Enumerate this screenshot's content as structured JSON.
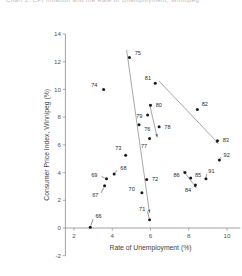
{
  "title_partial": "Chart 1.  CPI Inflation and the Rate of Unemployment, Winnipeg",
  "chart_data": {
    "type": "scatter",
    "title": "",
    "xlabel": "Rate of Unemployment (%)",
    "ylabel": "Consumer Price Index, Winnipeg (%)",
    "xlim": [
      1.2,
      10.8
    ],
    "ylim": [
      -2,
      14
    ],
    "xticks": [
      2,
      4,
      6,
      8,
      10
    ],
    "yticks": [
      -2,
      0,
      2,
      4,
      6,
      8,
      10,
      12,
      14
    ],
    "grid": false,
    "legend": "none",
    "point_label_field": "year",
    "points": [
      {
        "year": "66",
        "x": 2.85,
        "y": 0.05,
        "lx": 3.05,
        "ly": 0.85,
        "leader": true
      },
      {
        "year": "67",
        "x": 3.6,
        "y": 3.05,
        "lx": 3.35,
        "ly": 2.35,
        "leader": true
      },
      {
        "year": "68",
        "x": 4.1,
        "y": 3.9,
        "lx": 4.35,
        "ly": 4.35,
        "leader": true
      },
      {
        "year": "69",
        "x": 3.7,
        "y": 3.55,
        "lx": 3.3,
        "ly": 3.8,
        "leader": true
      },
      {
        "year": "70",
        "x": 5.55,
        "y": 2.55,
        "lx": 5.25,
        "ly": 2.8,
        "leader": false
      },
      {
        "year": "71",
        "x": 5.95,
        "y": 0.6,
        "lx": 5.8,
        "ly": 1.4,
        "leader": true
      },
      {
        "year": "72",
        "x": 5.8,
        "y": 3.5,
        "lx": 6.0,
        "ly": 3.55,
        "leader": false
      },
      {
        "year": "73",
        "x": 4.7,
        "y": 5.25,
        "lx": 4.55,
        "ly": 5.75,
        "leader": false
      },
      {
        "year": "74",
        "x": 3.55,
        "y": 10.0,
        "lx": 3.3,
        "ly": 10.35,
        "leader": false
      },
      {
        "year": "75",
        "x": 4.9,
        "y": 12.3,
        "lx": 5.1,
        "ly": 12.65,
        "leader": false
      },
      {
        "year": "76",
        "x": 5.4,
        "y": 7.45,
        "lx": 5.6,
        "ly": 7.15,
        "leader": false
      },
      {
        "year": "77",
        "x": 5.95,
        "y": 6.45,
        "lx": 5.9,
        "ly": 5.95,
        "leader": false
      },
      {
        "year": "78",
        "x": 6.45,
        "y": 7.3,
        "lx": 6.65,
        "ly": 7.3,
        "leader": false
      },
      {
        "year": "79",
        "x": 5.85,
        "y": 8.15,
        "lx": 5.65,
        "ly": 8.1,
        "leader": false
      },
      {
        "year": "80",
        "x": 6.0,
        "y": 8.85,
        "lx": 6.2,
        "ly": 8.85,
        "leader": false
      },
      {
        "year": "81",
        "x": 6.25,
        "y": 10.45,
        "lx": 6.1,
        "ly": 10.8,
        "leader": false
      },
      {
        "year": "82",
        "x": 8.45,
        "y": 8.55,
        "lx": 8.6,
        "ly": 8.95,
        "leader": false
      },
      {
        "year": "83",
        "x": 9.5,
        "y": 6.3,
        "lx": 9.7,
        "ly": 6.35,
        "leader": true
      },
      {
        "year": "84",
        "x": 8.35,
        "y": 3.1,
        "lx": 8.2,
        "ly": 2.75,
        "leader": false
      },
      {
        "year": "85",
        "x": 8.1,
        "y": 3.6,
        "lx": 8.25,
        "ly": 3.85,
        "leader": false
      },
      {
        "year": "86",
        "x": 7.8,
        "y": 4.0,
        "lx": 7.6,
        "ly": 3.8,
        "leader": true
      },
      {
        "year": "91",
        "x": 8.9,
        "y": 3.55,
        "lx": 8.95,
        "ly": 4.1,
        "leader": true
      },
      {
        "year": "92",
        "x": 9.6,
        "y": 4.9,
        "lx": 9.75,
        "ly": 5.3,
        "leader": true
      }
    ],
    "connectors": [
      {
        "name": "path-75-to-71",
        "from": [
          4.75,
          12.85
        ],
        "to": [
          5.95,
          1.1
        ]
      },
      {
        "name": "path-81-to-83",
        "from": [
          6.45,
          10.6
        ],
        "to": [
          9.55,
          6.1
        ]
      },
      {
        "name": "path-80-to-78",
        "from": [
          5.95,
          8.95
        ],
        "to": [
          6.35,
          6.55
        ]
      },
      {
        "name": "path-86-to-84",
        "from": [
          7.7,
          4.15
        ],
        "to": [
          8.4,
          2.9
        ]
      }
    ]
  }
}
